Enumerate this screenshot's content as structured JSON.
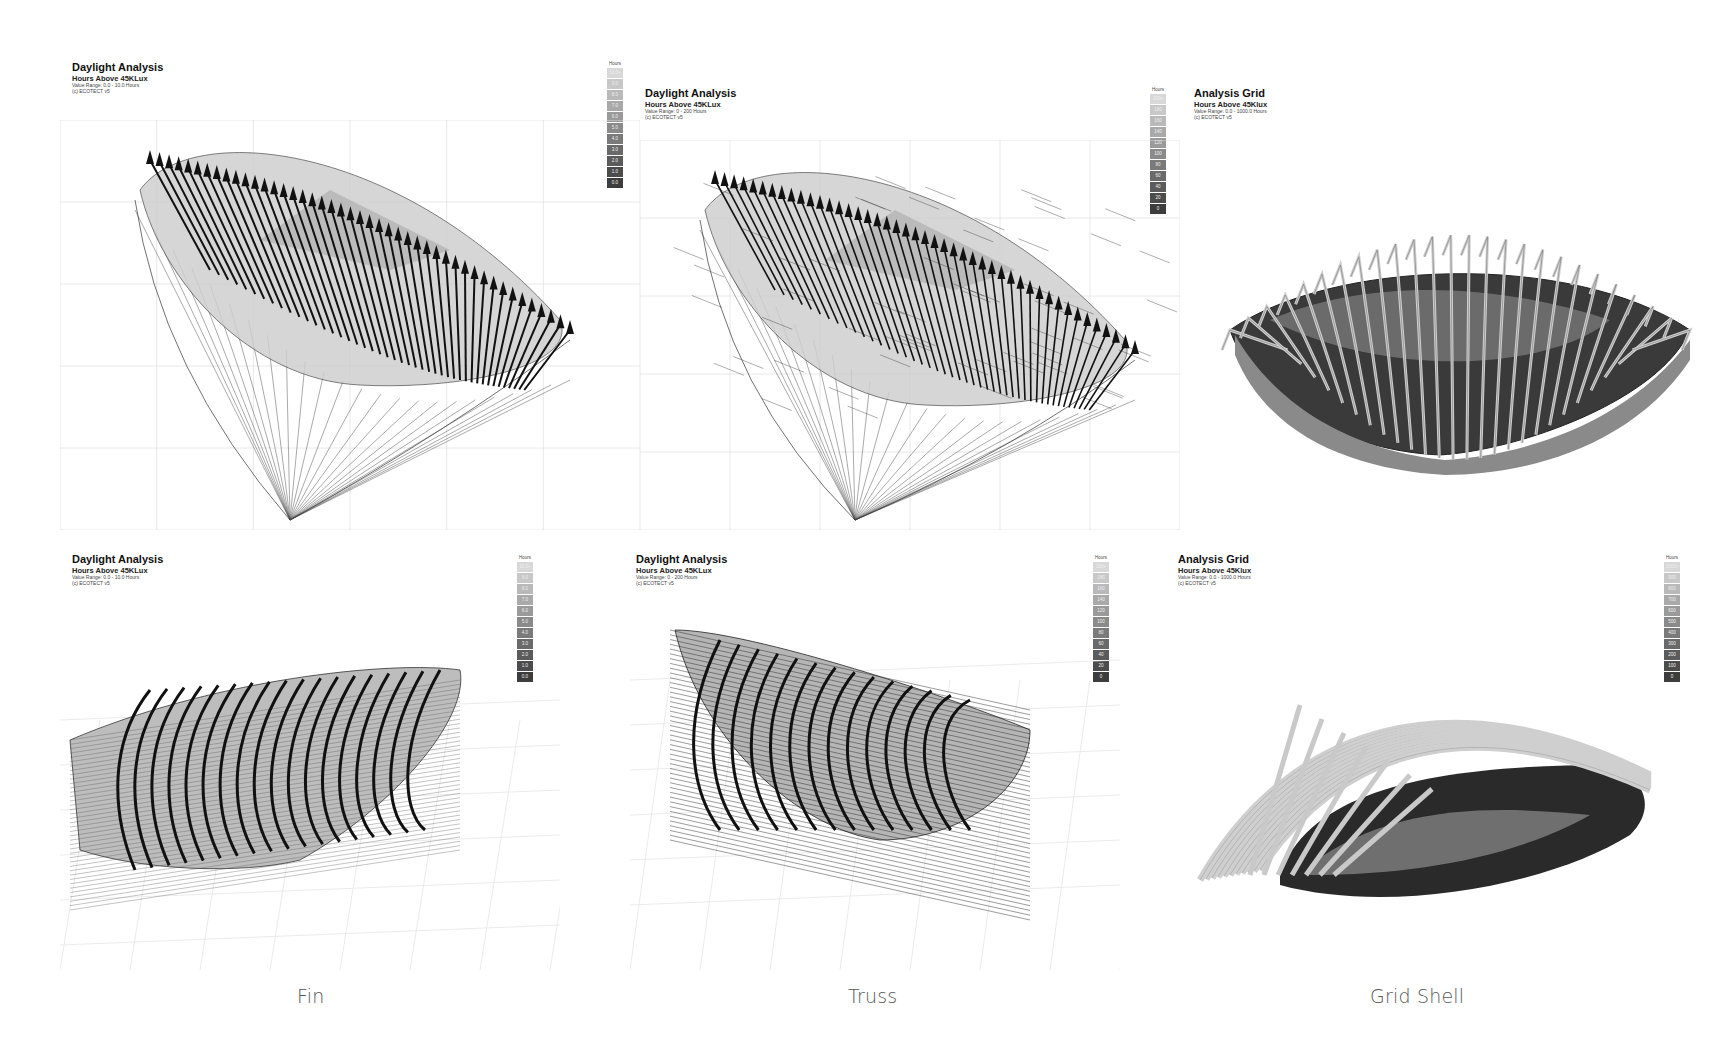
{
  "panels": [
    {
      "id": "fin-top",
      "title": "Daylight Analysis",
      "subtitle": "Hours Above 45KLux",
      "range": "Value Range: 0.0 - 10.0 Hours",
      "credit": "(c) ECOTECT v5",
      "legend": {
        "header": "Hours",
        "values": [
          "10.0+",
          "9.0",
          "8.0",
          "7.0",
          "6.0",
          "5.0",
          "4.0",
          "3.0",
          "2.0",
          "1.0",
          "0.0"
        ]
      }
    },
    {
      "id": "truss-top",
      "title": "Daylight Analysis",
      "subtitle": "Hours Above 45KLux",
      "range": "Value Range: 0 - 200 Hours",
      "credit": "(c) ECOTECT v5",
      "legend": {
        "header": "Hours",
        "values": [
          "200+",
          "180",
          "160",
          "140",
          "120",
          "100",
          "80",
          "60",
          "40",
          "20",
          "0"
        ]
      }
    },
    {
      "id": "gridshell-top",
      "title": "Analysis Grid",
      "subtitle": "Hours Above 45Klux",
      "range": "Value Range: 0.0 - 1000.0 Hours",
      "credit": "(c) ECOTECT v5"
    },
    {
      "id": "fin-bottom",
      "title": "Daylight Analysis",
      "subtitle": "Hours Above 45KLux",
      "range": "Value Range: 0.0 - 10.0 Hours",
      "credit": "(c) ECOTECT v5",
      "legend": {
        "header": "Hours",
        "values": [
          "10.0+",
          "9.0",
          "8.0",
          "7.0",
          "6.0",
          "5.0",
          "4.0",
          "3.0",
          "2.0",
          "1.0",
          "0.0"
        ]
      }
    },
    {
      "id": "truss-bottom",
      "title": "Daylight Analysis",
      "subtitle": "Hours Above 45KLux",
      "range": "Value Range: 0 - 200 Hours",
      "credit": "(c) ECOTECT v5",
      "legend": {
        "header": "Hours",
        "values": [
          "200+",
          "180",
          "160",
          "140",
          "120",
          "100",
          "80",
          "60",
          "40",
          "20",
          "0"
        ]
      }
    },
    {
      "id": "gridshell-bottom",
      "title": "Analysis Grid",
      "subtitle": "Hours Above 45Klux",
      "range": "Value Range: 0.0 - 1000.0 Hours",
      "credit": "(c) ECOTECT v5",
      "legend": {
        "header": "Hours",
        "values": [
          "1000+",
          "900",
          "800",
          "700",
          "600",
          "500",
          "400",
          "300",
          "200",
          "100",
          "0"
        ]
      }
    }
  ],
  "legend_colors": [
    "#d8d8d8",
    "#c8c8c8",
    "#b9b9b9",
    "#a9a9a9",
    "#9a9a9a",
    "#8a8a8a",
    "#7a7a7a",
    "#6a6a6a",
    "#5b5b5b",
    "#4c4c4c",
    "#3d3d3d"
  ],
  "captions": {
    "fin": "Fin",
    "truss": "Truss",
    "grid_shell": "Grid Shell"
  }
}
